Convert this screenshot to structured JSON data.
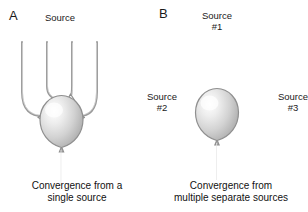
{
  "figure": {
    "background_color": "#ffffff",
    "text_color": "#1a1a1a",
    "neuron_fill_light": "#fdfdfd",
    "neuron_fill_mid": "#cfcfcf",
    "neuron_fill_dark": "#9a9a9a",
    "stroke_color": "#8c8c8c"
  },
  "panels": [
    {
      "id": "a",
      "letter": "A",
      "source_labels": [
        {
          "name": "source",
          "lines": [
            "Source"
          ]
        }
      ],
      "caption": {
        "lines": [
          "Convergence from a",
          "single source"
        ]
      },
      "input_count": 4
    },
    {
      "id": "b",
      "letter": "B",
      "source_labels": [
        {
          "name": "source-1",
          "lines": [
            "Source",
            "#1"
          ]
        },
        {
          "name": "source-2",
          "lines": [
            "Source",
            "#2"
          ]
        },
        {
          "name": "source-3",
          "lines": [
            "Source",
            "#3"
          ]
        }
      ],
      "caption": {
        "lines": [
          "Convergence from",
          "multiple separate sources"
        ]
      },
      "input_count": 3
    }
  ]
}
